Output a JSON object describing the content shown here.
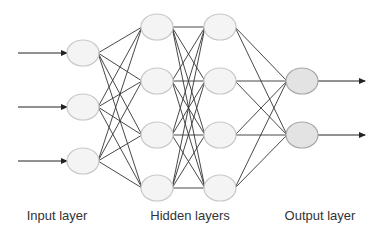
{
  "diagram": {
    "type": "neural-network",
    "colors": {
      "edge": "#333333",
      "node_stroke": "#c8c8c8",
      "node_fill": "#f4f4f4",
      "output_fill": "#e3e3e3",
      "output_stroke": "#a8a8a8"
    },
    "layers": [
      {
        "name": "input",
        "x": 83,
        "ys": [
          53,
          107,
          161
        ],
        "fill": "#f4f4f4"
      },
      {
        "name": "hidden1",
        "x": 157,
        "ys": [
          27,
          81,
          135,
          188
        ],
        "fill": "#f4f4f4"
      },
      {
        "name": "hidden2",
        "x": 220,
        "ys": [
          27,
          81,
          135,
          188
        ],
        "fill": "#f4f4f4"
      },
      {
        "name": "output",
        "x": 302,
        "ys": [
          81,
          135
        ],
        "fill": "#e3e3e3"
      }
    ],
    "node_rx": 16,
    "node_ry": 13,
    "input_arrows": {
      "x1": 18,
      "x2": 67
    },
    "output_arrows": {
      "x1": 318,
      "x2": 365
    }
  },
  "labels": {
    "input": "Input layer",
    "hidden": "Hidden layers",
    "output": "Output layer"
  }
}
